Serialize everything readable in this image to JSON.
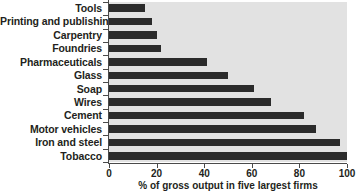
{
  "chart_data": {
    "type": "bar",
    "orientation": "horizontal",
    "title": "",
    "xlabel": "% of gross output in five largest firms",
    "ylabel": "",
    "xlim": [
      0,
      100
    ],
    "xticks": [
      0,
      20,
      40,
      60,
      80,
      100
    ],
    "xticklabels": [
      "0",
      "20",
      "40",
      "60",
      "80",
      "100"
    ],
    "grid": false,
    "legend": false,
    "categories": [
      "Tools",
      "Printing and publishing",
      "Carpentry",
      "Foundries",
      "Pharmaceuticals",
      "Glass",
      "Soap",
      "Wires",
      "Cement",
      "Motor vehicles",
      "Iron and steel",
      "Tobacco"
    ],
    "values": [
      15,
      18,
      20,
      22,
      41,
      50,
      61,
      68,
      82,
      87,
      97,
      100
    ],
    "colors": {
      "bar": "#2b2b2b",
      "plot_background": "#e2e2e2",
      "figure_background": "#ffffff",
      "axis": "#4a4a4a",
      "text": "#231f20"
    }
  }
}
